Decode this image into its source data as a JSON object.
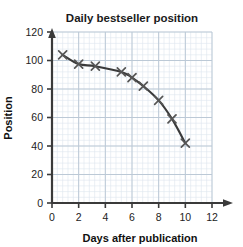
{
  "chart_data": {
    "type": "line",
    "title": "Daily bestseller position",
    "xlabel": "Days after publication",
    "ylabel": "Position",
    "xlim": [
      0,
      12
    ],
    "ylim": [
      0,
      120
    ],
    "xticks": [
      "0",
      "2",
      "4",
      "6",
      "8",
      "10",
      "12"
    ],
    "yticks": [
      "0",
      "20",
      "40",
      "60",
      "80",
      "100",
      "120"
    ],
    "grid": true,
    "grid_major_x": 2,
    "grid_major_y": 20,
    "grid_minor_x": 0.4,
    "grid_minor_y": 4,
    "legend": "none",
    "marker": "x",
    "line_color": "#3a3a3a",
    "marker_color": "#555555",
    "grid_color": "#cfd8e0",
    "axis_color": "#3a3a3a",
    "series": [
      {
        "name": "Daily bestseller position",
        "x": [
          0.8,
          2.0,
          3.25,
          5.2,
          6.0,
          6.85,
          8.0,
          9.0,
          10.0
        ],
        "y": [
          104,
          97.5,
          96,
          92,
          88,
          82,
          72,
          59,
          42
        ]
      }
    ]
  },
  "axis": {
    "x_tick_values": [
      0,
      2,
      4,
      6,
      8,
      10,
      12
    ],
    "y_tick_values": [
      0,
      20,
      40,
      60,
      80,
      100,
      120
    ]
  }
}
